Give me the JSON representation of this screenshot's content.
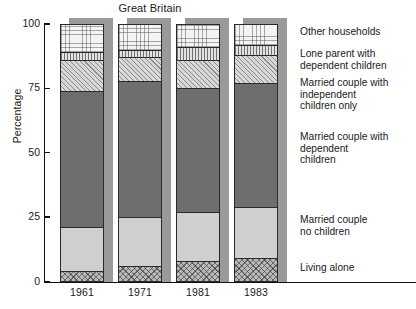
{
  "chart": {
    "title": "Great Britain",
    "ylabel": "Percentage"
  },
  "axis": {
    "yticks": [
      "100",
      "75",
      "50",
      "25",
      "0"
    ]
  },
  "legend": [
    {
      "key": "other",
      "label": "Other households"
    },
    {
      "key": "lone",
      "label": "Lone parent with\ndependent children"
    },
    {
      "key": "mcic",
      "label": "Married couple with\nindependent\nchildren only"
    },
    {
      "key": "mcdc",
      "label": "Married couple with\ndependent\nchildren"
    },
    {
      "key": "mcnc",
      "label": "Married couple\nno children"
    },
    {
      "key": "alone",
      "label": "Living alone"
    }
  ],
  "chart_data": {
    "type": "bar",
    "title": "Great Britain",
    "xlabel": "",
    "ylabel": "Percentage",
    "ylim": [
      0,
      100
    ],
    "ytick_values": [
      0,
      25,
      50,
      75,
      100
    ],
    "grid": false,
    "stacked": true,
    "legend_position": "right",
    "categories": [
      "1961",
      "1971",
      "1981",
      "1983"
    ],
    "series": [
      {
        "name": "Living alone",
        "values": [
          4,
          6,
          8,
          9
        ]
      },
      {
        "name": "Married couple no children",
        "values": [
          17,
          19,
          19,
          20
        ]
      },
      {
        "name": "Married couple with dependent children",
        "values": [
          53,
          53,
          48,
          48
        ]
      },
      {
        "name": "Married couple with independent children only",
        "values": [
          12,
          9,
          11,
          11
        ]
      },
      {
        "name": "Lone parent with dependent children",
        "values": [
          3,
          3,
          5,
          4
        ]
      },
      {
        "name": "Other households",
        "values": [
          11,
          10,
          9,
          8
        ]
      }
    ],
    "cumulative_tops": {
      "1961": {
        "alone": 4,
        "mcnc": 21,
        "mcdc": 74,
        "mcic": 86,
        "lone": 89,
        "other": 100
      },
      "1971": {
        "alone": 6,
        "mcnc": 25,
        "mcdc": 78,
        "mcic": 87,
        "lone": 90,
        "other": 100
      },
      "1981": {
        "alone": 8,
        "mcnc": 27,
        "mcdc": 75,
        "mcic": 86,
        "lone": 91,
        "other": 100
      },
      "1983": {
        "alone": 9,
        "mcnc": 29,
        "mcdc": 77,
        "mcic": 88,
        "lone": 92,
        "other": 100
      }
    }
  }
}
